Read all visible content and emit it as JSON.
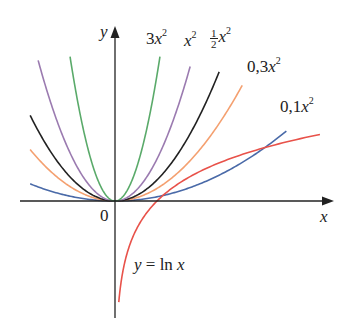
{
  "chart_data": {
    "type": "line",
    "title": "",
    "xlabel": "x",
    "ylabel": "y",
    "origin_label": "0",
    "xlim": [
      -2.05,
      5.2
    ],
    "ylim": [
      -2.45,
      4.2
    ],
    "grid": false,
    "legend": "inline labels",
    "series": [
      {
        "name": "3x^2",
        "label_coef": "3",
        "formula": "3*x^2",
        "color": "#5aaa6a",
        "x_range": [
          -1.07,
          1.07
        ]
      },
      {
        "name": "x^2",
        "label_coef": "",
        "formula": "x^2",
        "color": "#9b7bb0",
        "x_range": [
          -1.83,
          1.79
        ]
      },
      {
        "name": "1/2 x^2",
        "label_coef": "1/2",
        "formula": "0.5*x^2",
        "color": "#222222",
        "x_range": [
          -2.02,
          2.48
        ]
      },
      {
        "name": "0,3x^2",
        "label_coef": "0,3",
        "formula": "0.3*x^2",
        "color": "#f4a070",
        "x_range": [
          -2.02,
          3.03
        ]
      },
      {
        "name": "0,1x^2",
        "label_coef": "0,1",
        "formula": "0.1*x^2",
        "color": "#4a6aa8",
        "x_range": [
          -2.02,
          4.08
        ]
      },
      {
        "name": "y = ln x",
        "formula": "ln(x)",
        "color": "#e8524a",
        "x_range": [
          0.09,
          4.88
        ]
      }
    ],
    "annotations": [
      "3x²",
      "x²",
      "½x²",
      "0,3x²",
      "0,1x²",
      "y = ln x"
    ]
  },
  "labels": {
    "y_axis": "y",
    "x_axis": "x",
    "origin": "0",
    "l3": "3",
    "l1": "",
    "lhalf_num": "1",
    "lhalf_den": "2",
    "l03": "0,3",
    "l01": "0,1",
    "var": "x",
    "exp": "2",
    "ln_y": "y",
    "ln_eq": " = ln ",
    "ln_x": "x"
  }
}
